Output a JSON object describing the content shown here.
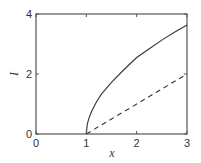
{
  "chart_data": {
    "type": "line",
    "title": "",
    "xlabel": "x",
    "ylabel": "I",
    "xlim": [
      0,
      3
    ],
    "ylim": [
      0,
      4
    ],
    "xticks": [
      0,
      1,
      2,
      3
    ],
    "yticks": [
      0,
      2,
      4
    ],
    "xtick_labels": [
      "0",
      "1",
      "2",
      "3"
    ],
    "ytick_labels": [
      "0",
      "2",
      "4"
    ],
    "grid": false,
    "legend": null,
    "series": [
      {
        "name": "solid",
        "style": "solid",
        "color": "#333333",
        "x": [
          1.0,
          1.02,
          1.05,
          1.1,
          1.2,
          1.3,
          1.5,
          1.75,
          2.0,
          2.25,
          2.5,
          2.75,
          3.0
        ],
        "y": [
          0.0,
          0.33,
          0.52,
          0.74,
          1.07,
          1.33,
          1.72,
          2.15,
          2.55,
          2.84,
          3.13,
          3.39,
          3.63
        ]
      },
      {
        "name": "dashed",
        "style": "dashed",
        "color": "#333333",
        "x": [
          1.0,
          1.5,
          2.0,
          2.5,
          3.0
        ],
        "y": [
          0.0,
          0.5,
          1.0,
          1.5,
          2.0
        ]
      }
    ]
  },
  "layout": {
    "plot_left": 36,
    "plot_top": 14,
    "plot_right": 187,
    "plot_bottom": 134
  }
}
